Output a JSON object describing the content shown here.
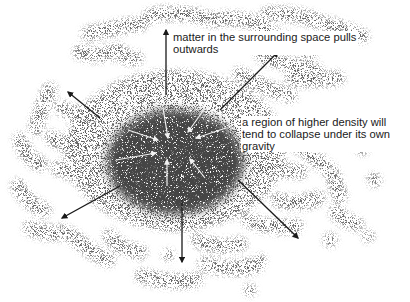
{
  "diagram": {
    "colors": {
      "background": "#ffffff",
      "matter": "#2a2a2a",
      "core": "#111111",
      "outward_arrow": "#1a1a1a",
      "inward_arrow": "#f2f2f2"
    },
    "labels": {
      "outward": {
        "line1": "matter in the surrounding space pulls",
        "line2": "outwards"
      },
      "inward": {
        "line1": "a region of higher density will",
        "line2": "tend to collapse under its own",
        "line3": "gravity"
      }
    },
    "core": {
      "cx": 175,
      "cy": 162,
      "rx": 68,
      "ry": 52
    },
    "outward_arrows": [
      {
        "name": "up",
        "x1": 166,
        "y1": 95,
        "x2": 166,
        "y2": 30
      },
      {
        "name": "upper-left",
        "x1": 100,
        "y1": 118,
        "x2": 68,
        "y2": 92
      },
      {
        "name": "upper-right",
        "x1": 220,
        "y1": 110,
        "x2": 278,
        "y2": 52
      },
      {
        "name": "lower-left",
        "x1": 120,
        "y1": 186,
        "x2": 62,
        "y2": 218
      },
      {
        "name": "down",
        "x1": 182,
        "y1": 200,
        "x2": 182,
        "y2": 262
      },
      {
        "name": "lower-right",
        "x1": 238,
        "y1": 180,
        "x2": 298,
        "y2": 238
      }
    ],
    "inward_arrows": [
      {
        "name": "from-top-left",
        "x1": 163,
        "y1": 108,
        "x2": 168,
        "y2": 138
      },
      {
        "name": "from-top-right",
        "x1": 205,
        "y1": 108,
        "x2": 188,
        "y2": 132
      },
      {
        "name": "from-left-up",
        "x1": 128,
        "y1": 130,
        "x2": 158,
        "y2": 140
      },
      {
        "name": "from-right",
        "x1": 226,
        "y1": 128,
        "x2": 196,
        "y2": 138
      },
      {
        "name": "from-left",
        "x1": 116,
        "y1": 160,
        "x2": 156,
        "y2": 153
      },
      {
        "name": "from-bottom",
        "x1": 167,
        "y1": 186,
        "x2": 167,
        "y2": 160
      },
      {
        "name": "from-lower-right",
        "x1": 205,
        "y1": 178,
        "x2": 190,
        "y2": 159
      }
    ]
  }
}
